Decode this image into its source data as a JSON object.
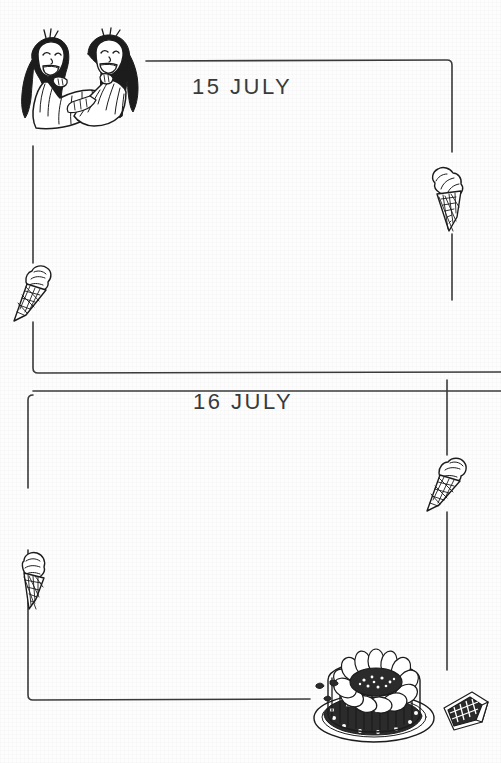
{
  "page": {
    "kind": "diary-page",
    "background_color": "#fdfdfd",
    "ink_color": "#2b2b2b",
    "width": 501,
    "height": 763
  },
  "entries": [
    {
      "date_label": "15 JULY",
      "day": "15",
      "month": "JULY",
      "box_name": "entry-box-15-july",
      "lines_written": ""
    },
    {
      "date_label": "16 JULY",
      "day": "16",
      "month": "JULY",
      "box_name": "entry-box-16-july",
      "lines_written": ""
    }
  ],
  "illustrations": [
    {
      "id": "two-girls-laughing",
      "caption": "two girls laughing together",
      "position": "top-left"
    },
    {
      "id": "ice-cream-cone-right-top",
      "caption": "ice cream cone",
      "position": "right of first entry"
    },
    {
      "id": "ice-cream-cone-left-top",
      "caption": "ice cream cone",
      "position": "left of first entry"
    },
    {
      "id": "ice-cream-cone-right-bottom",
      "caption": "ice cream cone",
      "position": "right of second entry"
    },
    {
      "id": "ice-cream-cone-left-bottom",
      "caption": "ice cream cone",
      "position": "left of second entry"
    },
    {
      "id": "charlotte-cake",
      "caption": "charlotte cake on a plate",
      "position": "bottom right"
    },
    {
      "id": "chocolate-bar",
      "caption": "chocolate bar",
      "position": "bottom right corner"
    }
  ]
}
